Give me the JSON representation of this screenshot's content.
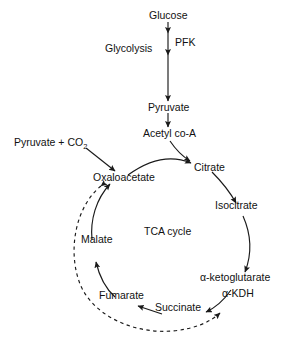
{
  "diagram": {
    "title_center": "TCA cycle",
    "pathway_labels": [
      {
        "name": "glycolysis",
        "text": "Glycolysis"
      }
    ],
    "metabolites": [
      {
        "id": "glucose",
        "text": "Glucose"
      },
      {
        "id": "pyruvate",
        "text": "Pyruvate"
      },
      {
        "id": "acetyl_coa",
        "text": "Acetyl co-A"
      },
      {
        "id": "pyruvate_co2",
        "text": "Pyruvate + CO",
        "subscript": "2"
      },
      {
        "id": "oxaloacetate",
        "text": "Oxaloacetate"
      },
      {
        "id": "citrate",
        "text": "Citrate"
      },
      {
        "id": "isocitrate",
        "text": "Isocitrate"
      },
      {
        "id": "alpha_ketoglutarate",
        "text": "α-ketoglutarate"
      },
      {
        "id": "succinate",
        "text": "Succinate"
      },
      {
        "id": "fumarate",
        "text": "Fumarate"
      },
      {
        "id": "malate",
        "text": "Malate"
      }
    ],
    "enzymes": [
      {
        "id": "pfk",
        "text": "PFK"
      },
      {
        "id": "alpha_kdh",
        "text": "α-KDH"
      }
    ],
    "edges": [
      {
        "from": "glucose",
        "to": "pyruvate",
        "style": "solid",
        "label": "PFK"
      },
      {
        "from": "pyruvate",
        "to": "acetyl_coa",
        "style": "solid"
      },
      {
        "from": "acetyl_coa",
        "to": "citrate",
        "style": "solid"
      },
      {
        "from": "pyruvate_co2",
        "to": "oxaloacetate",
        "style": "solid"
      },
      {
        "from": "oxaloacetate",
        "to": "citrate",
        "style": "solid"
      },
      {
        "from": "citrate",
        "to": "isocitrate",
        "style": "solid"
      },
      {
        "from": "isocitrate",
        "to": "alpha_ketoglutarate",
        "style": "solid"
      },
      {
        "from": "alpha_ketoglutarate",
        "to": "succinate",
        "style": "solid",
        "label": "α-KDH"
      },
      {
        "from": "succinate",
        "to": "fumarate",
        "style": "solid"
      },
      {
        "from": "fumarate",
        "to": "malate",
        "style": "solid"
      },
      {
        "from": "malate",
        "to": "oxaloacetate",
        "style": "solid"
      },
      {
        "from": "oxaloacetate",
        "to": "alpha_kdh",
        "style": "dashed",
        "meaning": "regulation"
      }
    ],
    "colors": {
      "stroke": "#1a1a1a",
      "text": "#111111",
      "background": "#ffffff"
    }
  }
}
